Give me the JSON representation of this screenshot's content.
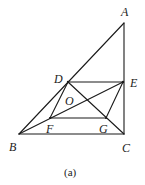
{
  "diagram": {
    "points": {
      "A": {
        "x": 124,
        "y": 23,
        "label": "A",
        "lx": 121,
        "ly": 16
      },
      "B": {
        "x": 19,
        "y": 134,
        "label": "B",
        "lx": 9,
        "ly": 151
      },
      "C": {
        "x": 124,
        "y": 134,
        "label": "C",
        "lx": 122,
        "ly": 152
      },
      "D": {
        "x": 68,
        "y": 82,
        "label": "D",
        "lx": 54,
        "ly": 83
      },
      "E": {
        "x": 123,
        "y": 82,
        "label": "E",
        "lx": 130,
        "ly": 87
      },
      "F": {
        "x": 50,
        "y": 118,
        "label": "F",
        "lx": 46,
        "ly": 133
      },
      "G": {
        "x": 106,
        "y": 118,
        "label": "G",
        "lx": 99,
        "ly": 133
      },
      "O": {
        "label": "O",
        "lx": 65,
        "ly": 105
      }
    },
    "segments": [
      [
        "A",
        "B"
      ],
      [
        "A",
        "C"
      ],
      [
        "B",
        "C"
      ],
      [
        "D",
        "E"
      ],
      [
        "F",
        "G"
      ],
      [
        "D",
        "F"
      ],
      [
        "G",
        "E"
      ],
      [
        "B",
        "E"
      ],
      [
        "D",
        "C"
      ]
    ],
    "caption": "(a)"
  }
}
